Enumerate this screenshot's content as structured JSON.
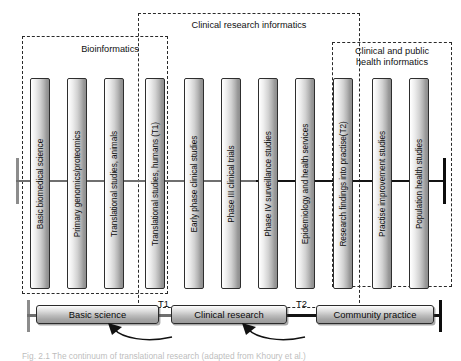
{
  "figure": {
    "caption": "Fig. 2.1 The continuum of translational research (adapted from Khoury et al.)",
    "groups": [
      {
        "name": "bioinformatics",
        "label": "Bioinformatics"
      },
      {
        "name": "clinical-research-informatics",
        "label": "Clinical research informatics"
      },
      {
        "name": "clinical-public-health-informatics",
        "label": "Clinical and public\nhealth informatics"
      }
    ],
    "bars": [
      {
        "label": "Basic biomedical science"
      },
      {
        "label": "Primary genomics/proteomics"
      },
      {
        "label": "Translational studies, animals"
      },
      {
        "label": "Translational studies, humans (T1)"
      },
      {
        "label": "Early phase clinical studies"
      },
      {
        "label": "Phase III clinical trials"
      },
      {
        "label": "Phase IV surveillance studies"
      },
      {
        "label": "Epidemiology and health services"
      },
      {
        "label": "Research findings into practise(T2)"
      },
      {
        "label": "Practise improvement studies"
      },
      {
        "label": "Population health studies"
      }
    ],
    "flow": {
      "stages": [
        {
          "label": "Basic science"
        },
        {
          "label": "Clinical research"
        },
        {
          "label": "Community practice"
        }
      ],
      "transitions": [
        {
          "label": "T1"
        },
        {
          "label": "T2"
        }
      ]
    },
    "colors": {
      "line": "#6f6f6f",
      "line_dark": "#141414",
      "box_border": "#2b2b2b",
      "dash": "#2a2a2a",
      "text": "#0a0a0a"
    }
  }
}
